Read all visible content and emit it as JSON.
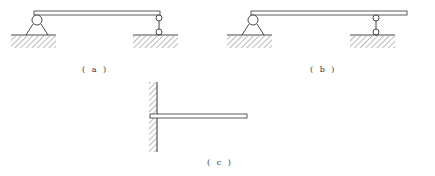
{
  "figure": {
    "panels": [
      {
        "id": "a",
        "label": "( a )",
        "description": "Simply supported beam: pin support at left, link (two-hinge bar) support at right end"
      },
      {
        "id": "b",
        "label": "( b )",
        "description": "Overhanging beam: pin support at left, link support at interior point, free right end"
      },
      {
        "id": "c",
        "label": "( c )",
        "description": "Cantilever beam fixed into a wall on the left"
      }
    ],
    "colors": {
      "line": "#333333",
      "background": "#ffffff"
    }
  }
}
